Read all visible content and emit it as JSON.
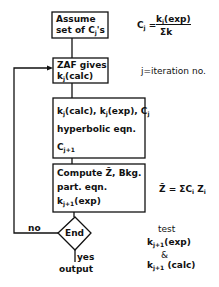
{
  "diagram": {
    "type": "flowchart",
    "boxes": [
      {
        "id": "assume",
        "lines": [
          "Assume",
          "set of Cj's"
        ]
      },
      {
        "id": "zaf",
        "lines": [
          "ZAF gives",
          "kj(calc)"
        ]
      },
      {
        "id": "hyperbolic",
        "lines": [
          "kj(calc), kj(exp), Cj",
          "hyperbolic eqn.",
          "Cj+1"
        ]
      },
      {
        "id": "compute",
        "lines": [
          "Compute Z̄, Bkg.",
          "part. eqn.",
          "kj+1(exp)"
        ]
      }
    ],
    "decision": {
      "label": "End",
      "no_label": "no",
      "yes_label": "yes",
      "output_label": "output"
    },
    "annotations": {
      "cj_formula_lhs": "Cj =",
      "cj_formula_num": "ki(exp)",
      "cj_formula_den": "Σk",
      "iteration_note": "j=iteration no.",
      "zbar_formula": "Z̄ = ΣCi Zi",
      "test_label": "test",
      "test_line1": "kj+1(exp)",
      "test_amp": "&",
      "test_line2": "kj+1 (calc)"
    }
  }
}
